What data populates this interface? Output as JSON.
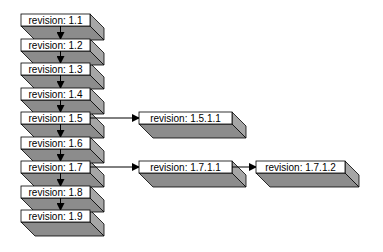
{
  "diagram": {
    "type": "revision-tree",
    "colors": {
      "face": "#ffffff",
      "shadow": "#8c8c8c",
      "shadow_side": "#a6a6a6",
      "outline": "#000000",
      "edge": "#000000"
    },
    "nodes": [
      {
        "id": "1.1",
        "label": "revision: 1.1",
        "col": 0,
        "row": 0
      },
      {
        "id": "1.2",
        "label": "revision: 1.2",
        "col": 0,
        "row": 1
      },
      {
        "id": "1.3",
        "label": "revision: 1.3",
        "col": 0,
        "row": 2
      },
      {
        "id": "1.4",
        "label": "revision: 1.4",
        "col": 0,
        "row": 3
      },
      {
        "id": "1.5",
        "label": "revision: 1.5",
        "col": 0,
        "row": 4
      },
      {
        "id": "1.6",
        "label": "revision: 1.6",
        "col": 0,
        "row": 5
      },
      {
        "id": "1.7",
        "label": "revision: 1.7",
        "col": 0,
        "row": 6
      },
      {
        "id": "1.8",
        "label": "revision: 1.8",
        "col": 0,
        "row": 7
      },
      {
        "id": "1.9",
        "label": "revision: 1.9",
        "col": 0,
        "row": 8
      },
      {
        "id": "1.5.1.1",
        "label": "revision: 1.5.1.1",
        "col": 1,
        "row": 4
      },
      {
        "id": "1.7.1.1",
        "label": "revision: 1.7.1.1",
        "col": 1,
        "row": 6
      },
      {
        "id": "1.7.1.2",
        "label": "revision: 1.7.1.2",
        "col": 2,
        "row": 6
      }
    ],
    "edges": [
      {
        "from": "1.1",
        "to": "1.2"
      },
      {
        "from": "1.2",
        "to": "1.3"
      },
      {
        "from": "1.3",
        "to": "1.4"
      },
      {
        "from": "1.4",
        "to": "1.5"
      },
      {
        "from": "1.5",
        "to": "1.6"
      },
      {
        "from": "1.6",
        "to": "1.7"
      },
      {
        "from": "1.7",
        "to": "1.8"
      },
      {
        "from": "1.8",
        "to": "1.9"
      },
      {
        "from": "1.5",
        "to": "1.5.1.1"
      },
      {
        "from": "1.7",
        "to": "1.7.1.1"
      },
      {
        "from": "1.7.1.1",
        "to": "1.7.1.2"
      }
    ]
  }
}
